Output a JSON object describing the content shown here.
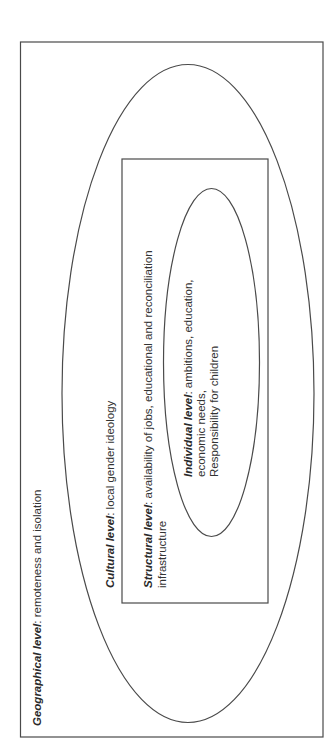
{
  "diagram": {
    "type": "nested-levels",
    "orientation": "rotated-90-ccw",
    "levels": [
      {
        "id": "geographical",
        "shape": "rectangle",
        "title": "Geographical level",
        "separator": ": ",
        "description": "remoteness and isolation"
      },
      {
        "id": "cultural",
        "shape": "ellipse",
        "title": "Cultural level",
        "separator": ": ",
        "description": "local gender ideology"
      },
      {
        "id": "structural",
        "shape": "rectangle",
        "title": "Structural level",
        "separator": ": ",
        "description": "availability of jobs, educational and reconciliation",
        "description_line2": "infrastructure"
      },
      {
        "id": "individual",
        "shape": "ellipse",
        "title": "Individual level",
        "separator": ": ",
        "description": "ambitions, education,",
        "description_line2": "economic needs,",
        "description_line3": "Responsibility for children"
      }
    ],
    "colors": {
      "stroke": "#4a4a4a",
      "text": "#333333",
      "background": "#ffffff"
    }
  }
}
